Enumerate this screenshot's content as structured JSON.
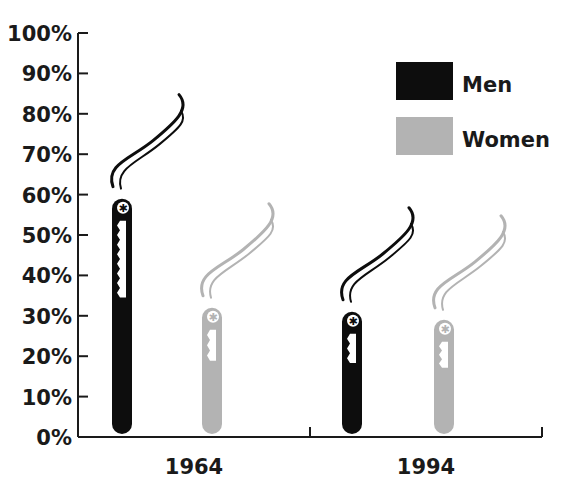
{
  "chart_data": {
    "type": "bar",
    "title": "",
    "xlabel": "",
    "ylabel": "",
    "ylim": [
      0,
      100
    ],
    "yticks": [
      0,
      10,
      20,
      30,
      40,
      50,
      60,
      70,
      80,
      90,
      100
    ],
    "ytick_labels": [
      "0%",
      "10%",
      "20%",
      "30%",
      "40%",
      "50%",
      "60%",
      "70%",
      "80%",
      "90%",
      "100%"
    ],
    "categories": [
      "1964",
      "1994"
    ],
    "series": [
      {
        "name": "Men",
        "color": "#0d0d0d",
        "values": [
          59,
          31
        ]
      },
      {
        "name": "Women",
        "color": "#b3b3b3",
        "values": [
          32,
          29
        ]
      }
    ],
    "bar_style": "smoking cigarette pictograph",
    "grid": false,
    "legend": {
      "position": "top-right",
      "entries": [
        "Men",
        "Women"
      ]
    }
  },
  "legend": {
    "men_label": "Men",
    "women_label": "Women"
  },
  "colors": {
    "men": "#0d0d0d",
    "women": "#b3b3b3",
    "axis": "#1a1a1a",
    "background": "#ffffff"
  }
}
